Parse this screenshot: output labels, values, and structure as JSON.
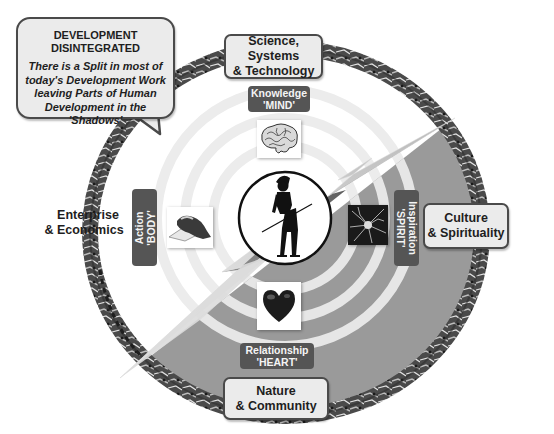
{
  "callout": {
    "title_line1": "DEVELOPMENT",
    "title_line2": "DISINTEGRATED",
    "body_lines": [
      "There is a Split in most of",
      "today's Development Work",
      "leaving Parts of Human",
      "Development in the 'Shadows'"
    ]
  },
  "outer_domains": {
    "top": {
      "line1": "Science, Systems",
      "line2": "& Technology"
    },
    "right": {
      "line1": "Culture",
      "line2": "& Spirituality"
    },
    "bottom": {
      "line1": "Nature",
      "line2": "& Community"
    },
    "left": {
      "line1": "Enterprise",
      "line2": "& Economics"
    }
  },
  "inner_labels": {
    "mind": {
      "line1": "Knowledge",
      "line2": "'MIND'"
    },
    "body": {
      "line1": "Action",
      "line2": "'BODY'"
    },
    "spirit": {
      "line1": "Inspiration",
      "line2": "'SPIRIT'"
    },
    "heart": {
      "line1": "Relationship",
      "line2": "'HEART'"
    }
  },
  "icons": {
    "center": "split-human-figure-icon",
    "mind": "brain-icon",
    "body": "clasped-hands-icon",
    "spirit": "neuron-icon",
    "heart": "heart-icon",
    "bolt": "lightning-bolt-icon"
  },
  "colors": {
    "ring": "#3a3a3a",
    "label_bg": "#555555",
    "box_bg": "#ebebeb",
    "shadow_gray": "#9a9a9a",
    "bolt_dark": "#3c3c3c",
    "bolt_light": "#c8c8c8"
  }
}
